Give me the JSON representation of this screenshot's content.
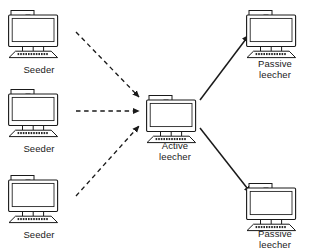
{
  "diagram": {
    "background_color": "#ffffff",
    "stroke_color": "#1a1a1a",
    "text_color": "#1a1a1a",
    "nodes": [
      {
        "id": "seeder-top",
        "label": "Seeder",
        "role": "seeder",
        "icon": "desktop-computer-icon",
        "x": 8,
        "y": 8,
        "label_x": 8,
        "label_y": 64,
        "label_width": 62
      },
      {
        "id": "seeder-middle",
        "label": "Seeder",
        "role": "seeder",
        "icon": "desktop-computer-icon",
        "x": 8,
        "y": 87,
        "label_x": 8,
        "label_y": 143,
        "label_width": 62
      },
      {
        "id": "seeder-bottom",
        "label": "Seeder",
        "role": "seeder",
        "icon": "desktop-computer-icon",
        "x": 8,
        "y": 173,
        "label_x": 8,
        "label_y": 229,
        "label_width": 62
      },
      {
        "id": "active-leecher",
        "label": "Active\nleecher",
        "role": "active-leecher",
        "icon": "desktop-computer-icon",
        "x": 146,
        "y": 93,
        "label_x": 140,
        "label_y": 140,
        "label_width": 70
      },
      {
        "id": "passive-leecher-top",
        "label": "Passive\nleecher",
        "role": "passive-leecher",
        "icon": "desktop-computer-icon",
        "x": 246,
        "y": 8,
        "label_x": 240,
        "label_y": 58,
        "label_width": 70
      },
      {
        "id": "passive-leecher-bottom",
        "label": "Passive\nleecher",
        "role": "passive-leecher",
        "icon": "desktop-computer-icon",
        "x": 246,
        "y": 181,
        "label_x": 240,
        "label_y": 228,
        "label_width": 70
      }
    ],
    "edges": [
      {
        "id": "edge-seeder-top-to-active",
        "from": "seeder-top",
        "to": "active-leecher",
        "style": "dashed",
        "x1": 76,
        "y1": 32,
        "x2": 139,
        "y2": 97
      },
      {
        "id": "edge-seeder-middle-to-active",
        "from": "seeder-middle",
        "to": "active-leecher",
        "style": "dashed",
        "x1": 76,
        "y1": 111,
        "x2": 139,
        "y2": 111
      },
      {
        "id": "edge-seeder-bottom-to-active",
        "from": "seeder-bottom",
        "to": "active-leecher",
        "style": "dashed",
        "x1": 76,
        "y1": 196,
        "x2": 139,
        "y2": 126
      },
      {
        "id": "edge-active-to-passive-top",
        "from": "active-leecher",
        "to": "passive-leecher-top",
        "style": "solid",
        "x1": 200,
        "y1": 100,
        "x2": 249,
        "y2": 35
      },
      {
        "id": "edge-active-to-passive-bottom",
        "from": "active-leecher",
        "to": "passive-leecher-bottom",
        "style": "solid",
        "x1": 200,
        "y1": 128,
        "x2": 251,
        "y2": 193
      }
    ]
  }
}
